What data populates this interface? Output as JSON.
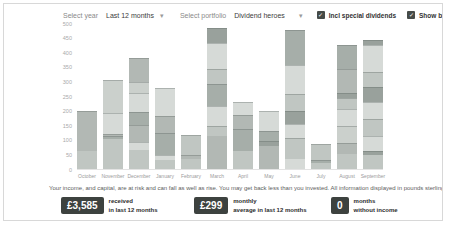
{
  "header": {
    "select_year_label": "Select year",
    "year_value": "Last 12 months",
    "select_portfolio_label": "Select portfolio",
    "portfolio_value": "Dividend heroes",
    "incl_special_dividends": {
      "label": "Incl special dividends",
      "checked": true
    },
    "show_breakdown": {
      "label": "Show breakdown",
      "checked": true
    }
  },
  "chart_data": {
    "type": "bar",
    "stacked": true,
    "title": "",
    "xlabel": "",
    "ylabel": "",
    "ylim": [
      0,
      500
    ],
    "yticks": [
      0,
      50,
      100,
      150,
      200,
      250,
      300,
      350,
      400,
      450,
      500
    ],
    "grid": false,
    "legend": "none",
    "categories": [
      "October",
      "November",
      "December",
      "January",
      "February",
      "March",
      "April",
      "May",
      "June",
      "July",
      "August",
      "September"
    ],
    "totals": [
      200,
      305,
      380,
      277,
      118,
      484,
      230,
      199,
      476,
      87,
      424,
      441
    ],
    "units": "GBP",
    "series_segments": [
      [
        [
          62,
          "m"
        ],
        [
          138,
          "m2"
        ]
      ],
      [
        [
          103,
          "m"
        ],
        [
          9,
          "m4"
        ],
        [
          8,
          "m2"
        ],
        [
          71,
          "l"
        ],
        [
          114,
          "m3"
        ]
      ],
      [
        [
          65,
          "m"
        ],
        [
          28,
          "l"
        ],
        [
          58,
          "m2"
        ],
        [
          44,
          "m4"
        ],
        [
          66,
          "l"
        ],
        [
          36,
          "m3"
        ],
        [
          83,
          "m2"
        ]
      ],
      [
        [
          32,
          "m"
        ],
        [
          15,
          "l"
        ],
        [
          78,
          "m4"
        ],
        [
          56,
          "m2"
        ],
        [
          96,
          "l"
        ]
      ],
      [
        [
          35,
          "m"
        ],
        [
          12,
          "m2"
        ],
        [
          71,
          "m"
        ]
      ],
      [
        [
          112,
          "m2"
        ],
        [
          35,
          "m"
        ],
        [
          69,
          "l"
        ],
        [
          75,
          "m4"
        ],
        [
          52,
          "m"
        ],
        [
          87,
          "l"
        ],
        [
          54,
          "d"
        ]
      ],
      [
        [
          61,
          "m"
        ],
        [
          75,
          "m4"
        ],
        [
          48,
          "m2"
        ],
        [
          46,
          "l"
        ]
      ],
      [
        [
          80,
          "m2"
        ],
        [
          16,
          "d"
        ],
        [
          34,
          "m4"
        ],
        [
          69,
          "l"
        ]
      ],
      [
        [
          35,
          "l"
        ],
        [
          70,
          "m"
        ],
        [
          50,
          "l"
        ],
        [
          45,
          "d"
        ],
        [
          58,
          "m"
        ],
        [
          98,
          "l"
        ],
        [
          120,
          "m4"
        ]
      ],
      [
        [
          22,
          "m"
        ],
        [
          10,
          "m4"
        ],
        [
          55,
          "m"
        ]
      ],
      [
        [
          53,
          "m"
        ],
        [
          35,
          "m2"
        ],
        [
          58,
          "m3"
        ],
        [
          58,
          "l"
        ],
        [
          41,
          "m"
        ],
        [
          17,
          "d"
        ],
        [
          81,
          "m2"
        ],
        [
          81,
          "m4"
        ]
      ],
      [
        [
          49,
          "m"
        ],
        [
          14,
          "d"
        ],
        [
          49,
          "l"
        ],
        [
          58,
          "m"
        ],
        [
          58,
          "l"
        ],
        [
          52,
          "d"
        ],
        [
          52,
          "m"
        ],
        [
          94,
          "l"
        ],
        [
          15,
          "d"
        ]
      ]
    ]
  },
  "disclaimer": "Your income, and capital, are at risk and can fall as well as rise. You may get back less than you invested. All information displayed in pounds sterling.",
  "summary": [
    {
      "value": "£3,585",
      "label_line1": "received",
      "label_line2": "in last 12 months"
    },
    {
      "value": "£299",
      "label_line1": "monthly",
      "label_line2": "average in last 12 months"
    },
    {
      "value": "0",
      "label_line1": "months",
      "label_line2": "without income"
    }
  ],
  "icons": {
    "dropdown_chevron": "▾",
    "checkbox_check": "check-mark"
  },
  "colors": {
    "card_border": "#d8d8d8",
    "summary_box_bg": "#3d423f",
    "checkbox_bg": "#464b48",
    "segment_shades": {
      "l": "#d6dad7",
      "m": "#c0c6c2",
      "m2": "#b2b8b4",
      "m3": "#cbd0cc",
      "m4": "#a6aea9",
      "d": "#99a19c"
    },
    "segment_divider": "rgba(95,104,99,0.35)"
  }
}
